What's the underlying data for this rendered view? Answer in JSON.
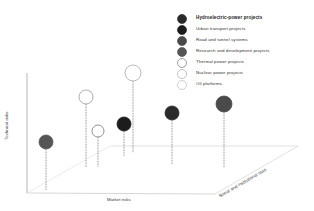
{
  "chart_data": {
    "type": "scatter",
    "title": "",
    "xlabel": "Market risks",
    "ylabel": "Technical risks",
    "zlabel": "Social and institutional risks",
    "legend_position": "top-right",
    "grid": false,
    "legend": [
      {
        "label": "Hydroelectric-power projects",
        "fill": "#2a2a2a",
        "stroke": "#2a2a2a",
        "bold": true
      },
      {
        "label": "Urban transport projects",
        "fill": "#1c1c1c",
        "stroke": "#1c1c1c",
        "bold": false
      },
      {
        "label": "Road and tunnel systems",
        "fill": "#4a4a4a",
        "stroke": "#4a4a4a",
        "bold": false
      },
      {
        "label": "Research and development projects",
        "fill": "#555555",
        "stroke": "#555555",
        "bold": false
      },
      {
        "label": "Thermal power projects",
        "fill": "#ffffff",
        "stroke": "#777777",
        "bold": false
      },
      {
        "label": "Nuclear power projects",
        "fill": "#ffffff",
        "stroke": "#aaaaaa",
        "bold": false
      },
      {
        "label": "Oil platforms",
        "fill": "#ffffff",
        "stroke": "#bbbbbb",
        "bold": false
      }
    ],
    "points": [
      {
        "series": "Research and development projects",
        "cx": 46,
        "cy": 142,
        "r": 7,
        "base_y": 190,
        "fill": "#555555",
        "stroke": "#555555"
      },
      {
        "series": "Nuclear power projects",
        "cx": 86,
        "cy": 97,
        "r": 7,
        "base_y": 167,
        "fill": "#ffffff",
        "stroke": "#999999"
      },
      {
        "series": "Thermal power projects",
        "cx": 98,
        "cy": 131,
        "r": 6,
        "base_y": 167,
        "fill": "#ffffff",
        "stroke": "#777777"
      },
      {
        "series": "Urban transport projects",
        "cx": 124,
        "cy": 124,
        "r": 7,
        "base_y": 156,
        "fill": "#1c1c1c",
        "stroke": "#1c1c1c"
      },
      {
        "series": "Oil platforms",
        "cx": 133,
        "cy": 73,
        "r": 8,
        "base_y": 153,
        "fill": "#ffffff",
        "stroke": "#aaaaaa"
      },
      {
        "series": "Hydroelectric-power projects",
        "cx": 172,
        "cy": 113,
        "r": 7,
        "base_y": 164,
        "fill": "#2a2a2a",
        "stroke": "#2a2a2a"
      },
      {
        "series": "Road and tunnel systems",
        "cx": 224,
        "cy": 104,
        "r": 8,
        "base_y": 168,
        "fill": "#4a4a4a",
        "stroke": "#4a4a4a"
      }
    ]
  }
}
